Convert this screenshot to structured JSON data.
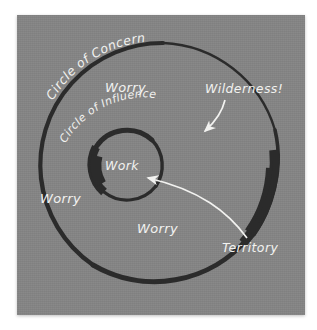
{
  "diagram": {
    "background_color": "#858585",
    "page_color": "#ffffff",
    "ink_color": "#2b2b2b",
    "text_color": "#f2f2f0",
    "labels": {
      "circle_of_concern": "Circle of Concern",
      "circle_of_influence": "Circle of Influence",
      "work": "Work",
      "worry_top": "Worry",
      "worry_left": "Worry",
      "worry_bottom": "Worry",
      "wilderness": "Wilderness!",
      "territory": "Territory"
    },
    "annotations": [
      {
        "name": "wilderness",
        "label": "Wilderness!",
        "points_to": "outer-ring-right-edge",
        "arrow": "curved-down-left"
      },
      {
        "name": "territory",
        "label": "Territory",
        "points_to": "inner-work-circle",
        "arrow": "curved-up-left"
      }
    ],
    "shapes": [
      {
        "name": "outer-circle",
        "label": "Circle of Concern",
        "cx": 161,
        "cy": 165,
        "r": 123,
        "stroke": "#2b2b2b"
      },
      {
        "name": "inner-circle",
        "label": "Circle of Influence",
        "cx": 126,
        "cy": 165,
        "r": 36,
        "stroke": "#2b2b2b"
      }
    ]
  }
}
